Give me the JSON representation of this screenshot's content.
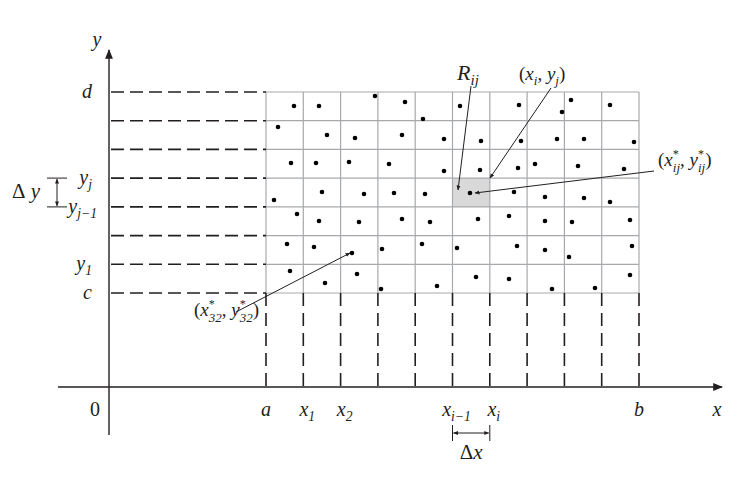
{
  "diagram": {
    "colors": {
      "ink": "#231f20",
      "grid": "#a7a9ac",
      "shaded_cell": "#d9d9d9",
      "dot": "#000000"
    },
    "axes": {
      "origin_label": "0",
      "x_axis_label": "x",
      "y_axis_label": "y",
      "x_axis": {
        "x1": 58,
        "x2": 722,
        "y": 387
      },
      "y_axis": {
        "x": 109,
        "y1": 435,
        "y2": 50
      }
    },
    "grid": {
      "columns": [
        266,
        303.3,
        340.6,
        377.9,
        415.2,
        452.5,
        489.8,
        527.1,
        564.4,
        601.7,
        639
      ],
      "rows": [
        92,
        120.7,
        149.4,
        178.1,
        206.9,
        235.6,
        264.3,
        293
      ],
      "shaded_cell": {
        "x": 452.5,
        "y": 178.1,
        "w": 37.3,
        "h": 28.8
      }
    },
    "x_labels": [
      {
        "text": "a",
        "sub": "",
        "x": 266
      },
      {
        "text": "x",
        "sub": "1",
        "x": 303.3
      },
      {
        "text": "x",
        "sub": "2",
        "x": 340.6
      },
      {
        "text": "x",
        "sub": "i−1",
        "x": 452.5
      },
      {
        "text": "x",
        "sub": "i",
        "x": 489.8
      },
      {
        "text": "b",
        "sub": "",
        "x": 639
      }
    ],
    "y_labels": [
      {
        "text": "d",
        "sub": "",
        "y": 92
      },
      {
        "text": "y",
        "sub": "j",
        "y": 178.1
      },
      {
        "text": "y",
        "sub": "j−1",
        "y": 206.9
      },
      {
        "text": "y",
        "sub": "1",
        "y": 264.3
      },
      {
        "text": "c",
        "sub": "",
        "y": 293
      }
    ],
    "delta_x": {
      "label": "Δx",
      "x1": 452.5,
      "x2": 489.8,
      "y": 433
    },
    "delta_y": {
      "label": "Δy",
      "y1": 178.1,
      "y2": 206.9,
      "x": 57
    },
    "annotations": [
      {
        "name": "R-ij-label",
        "text": "R",
        "sub": "ij",
        "tx": 458,
        "ty": 80,
        "from": [
          471,
          86
        ],
        "to": [
          458,
          190
        ]
      },
      {
        "name": "xi-yj-label",
        "text": "(x_i, y_j)",
        "tx": 554,
        "ty": 80,
        "from": [
          551,
          88
        ],
        "to": [
          490,
          178
        ]
      },
      {
        "name": "x-star-ij-label",
        "text": "(x*_ij, y*_ij)",
        "tx": 658,
        "ty": 172,
        "from": [
          654,
          171
        ],
        "to": [
          475,
          193
        ]
      },
      {
        "name": "x-star-32-label",
        "text": "(x*_32, y*_32)",
        "tx": 194,
        "ty": 322,
        "from": [
          236,
          312
        ],
        "to": [
          350,
          253
        ]
      }
    ],
    "sample_points": [
      [
        294,
        106
      ],
      [
        319,
        106
      ],
      [
        375,
        96
      ],
      [
        405,
        102
      ],
      [
        423,
        119
      ],
      [
        460,
        106
      ],
      [
        519,
        105
      ],
      [
        562,
        112
      ],
      [
        571,
        100
      ],
      [
        610,
        105
      ],
      [
        278,
        127
      ],
      [
        327,
        135
      ],
      [
        355,
        138
      ],
      [
        402,
        135
      ],
      [
        444,
        139
      ],
      [
        481,
        141
      ],
      [
        521,
        141
      ],
      [
        557,
        139
      ],
      [
        584,
        139
      ],
      [
        634,
        142
      ],
      [
        291,
        163
      ],
      [
        316,
        163
      ],
      [
        349,
        162
      ],
      [
        389,
        164
      ],
      [
        444,
        171
      ],
      [
        480,
        170
      ],
      [
        518,
        168
      ],
      [
        535,
        164
      ],
      [
        578,
        166
      ],
      [
        624,
        169
      ],
      [
        274,
        200
      ],
      [
        322,
        192
      ],
      [
        364,
        194
      ],
      [
        394,
        193
      ],
      [
        425,
        194
      ],
      [
        470,
        193
      ],
      [
        514,
        192
      ],
      [
        545,
        197
      ],
      [
        584,
        198
      ],
      [
        610,
        202
      ],
      [
        297,
        214
      ],
      [
        319,
        221
      ],
      [
        359,
        222
      ],
      [
        402,
        219
      ],
      [
        430,
        222
      ],
      [
        478,
        219
      ],
      [
        509,
        216
      ],
      [
        545,
        221
      ],
      [
        572,
        222
      ],
      [
        630,
        220
      ],
      [
        287,
        244
      ],
      [
        314,
        247
      ],
      [
        352,
        253
      ],
      [
        382,
        249
      ],
      [
        422,
        244
      ],
      [
        457,
        248
      ],
      [
        517,
        246
      ],
      [
        545,
        250
      ],
      [
        569,
        257
      ],
      [
        632,
        246
      ],
      [
        290,
        271
      ],
      [
        325,
        283
      ],
      [
        357,
        274
      ],
      [
        381,
        289
      ],
      [
        437,
        286
      ],
      [
        476,
        277
      ],
      [
        509,
        279
      ],
      [
        552,
        289
      ],
      [
        595,
        288
      ],
      [
        630,
        275
      ]
    ]
  }
}
